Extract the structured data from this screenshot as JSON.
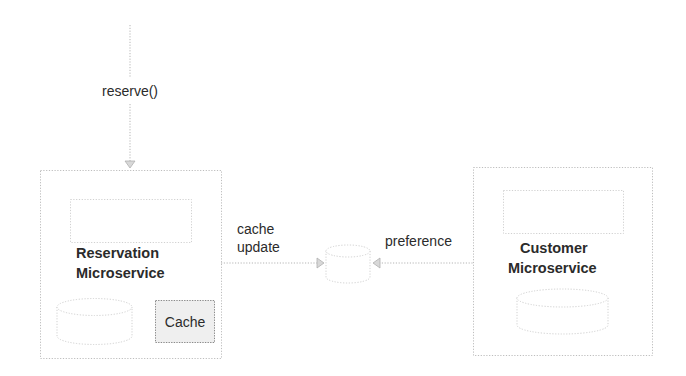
{
  "diagram": {
    "type": "architecture",
    "colors": {
      "stroke": "#bdbdbd",
      "text": "#2b2b2b",
      "cache_fill": "#efefef",
      "cache_stroke": "#8a8a8a"
    },
    "incoming_call": {
      "label": "reserve()"
    },
    "reservation_service": {
      "title_line1": "Reservation",
      "title_line2": "Microservice",
      "cache_label": "Cache",
      "database_icon": "database-cylinder-icon"
    },
    "customer_service": {
      "title_line1": "Customer",
      "title_line2": "Microservice",
      "database_icon": "database-cylinder-icon"
    },
    "shared_store": {
      "icon": "database-cylinder-icon"
    },
    "edges": [
      {
        "from": "external",
        "to": "reservation_service",
        "label": "reserve()"
      },
      {
        "from": "reservation_service",
        "to": "shared_store",
        "label_line1": "cache",
        "label_line2": "update"
      },
      {
        "from": "customer_service",
        "to": "shared_store",
        "label": "preference"
      }
    ]
  }
}
